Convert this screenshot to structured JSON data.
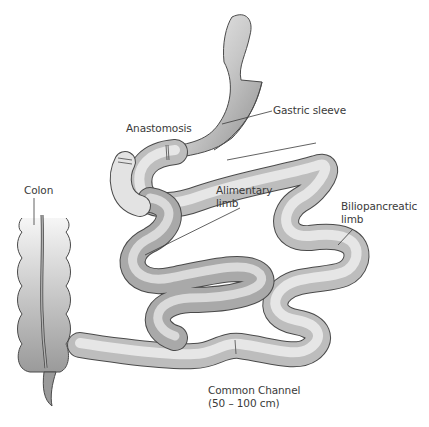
{
  "diagram": {
    "type": "medical-illustration",
    "labels": {
      "gastric_sleeve": "Gastric sleeve",
      "anastomosis": "Anastomosis",
      "colon": "Colon",
      "alimentary_limb_line1": "Alimentary",
      "alimentary_limb_line2": "limb",
      "biliopancreatic_line1": "Biliopancreatic",
      "biliopancreatic_line2": "limb",
      "common_channel_line1": "Common Channel",
      "common_channel_line2": "(50 – 100 cm)"
    },
    "colors": {
      "background": "#ffffff",
      "tube_light": "#f2f2f2",
      "tube_dark": "#9a9a9a",
      "outline": "#4a4a4a",
      "text": "#3a3a3a"
    }
  }
}
